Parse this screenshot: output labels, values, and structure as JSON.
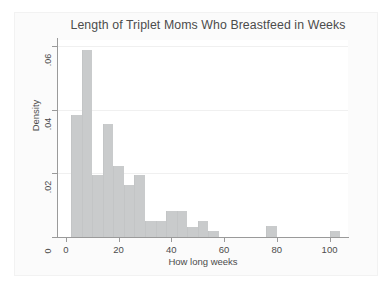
{
  "chart_data": {
    "type": "bar",
    "title": "Length of Triplet Moms Who Breastfeed in Weeks",
    "xlabel": "How long weeks",
    "ylabel": "Density",
    "xlim": [
      -3,
      107
    ],
    "ylim": [
      0,
      0.062
    ],
    "grid": "horizontal",
    "legend": "none",
    "bin_width": 4,
    "bar_color": "#c9cbcc",
    "xticks": [
      "0",
      "20",
      "40",
      "60",
      "80",
      "100"
    ],
    "xtick_values": [
      0,
      20,
      40,
      60,
      80,
      100
    ],
    "yticks": [
      "0",
      ".02",
      ".04",
      ".06"
    ],
    "ytick_values": [
      0,
      0.02,
      0.04,
      0.06
    ],
    "bins": [
      {
        "x0": 2,
        "x1": 6,
        "density": 0.0385
      },
      {
        "x0": 6,
        "x1": 10,
        "density": 0.059
      },
      {
        "x0": 10,
        "x1": 14,
        "density": 0.0195
      },
      {
        "x0": 14,
        "x1": 18,
        "density": 0.0355
      },
      {
        "x0": 18,
        "x1": 22,
        "density": 0.0222
      },
      {
        "x0": 22,
        "x1": 26,
        "density": 0.0165
      },
      {
        "x0": 26,
        "x1": 30,
        "density": 0.0195
      },
      {
        "x0": 30,
        "x1": 34,
        "density": 0.005
      },
      {
        "x0": 34,
        "x1": 38,
        "density": 0.005
      },
      {
        "x0": 38,
        "x1": 42,
        "density": 0.0082
      },
      {
        "x0": 42,
        "x1": 46,
        "density": 0.0082
      },
      {
        "x0": 46,
        "x1": 50,
        "density": 0.0032
      },
      {
        "x0": 50,
        "x1": 54,
        "density": 0.005
      },
      {
        "x0": 54,
        "x1": 58,
        "density": 0.0018
      },
      {
        "x0": 76,
        "x1": 80,
        "density": 0.0035
      },
      {
        "x0": 100,
        "x1": 104,
        "density": 0.0018
      }
    ]
  },
  "axis": {
    "y_title": "Density",
    "x_title": "How long weeks"
  }
}
